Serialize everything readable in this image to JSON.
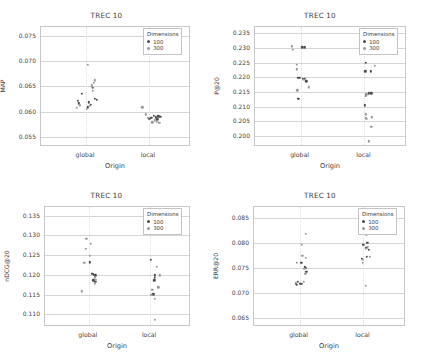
{
  "figure": {
    "panels_order": [
      "map",
      "p20",
      "ndcg20",
      "err20"
    ],
    "legend_title": "Dimensions",
    "legend_entries": [
      {
        "label": "100",
        "color": "#4d4d4d"
      },
      {
        "label": "300",
        "color": "#9a9a9a"
      }
    ],
    "shared_xlabel": "Origin",
    "shared_categories": [
      "global",
      "local"
    ],
    "shared_title": "TREC 10"
  },
  "chart_data": [
    {
      "type": "scatter",
      "id": "map",
      "title": "TREC 10",
      "xlabel": "Origin",
      "ylabel": "MAP",
      "categories": [
        "global",
        "local"
      ],
      "yticks": [
        0.055,
        0.06,
        0.065,
        0.07,
        0.075
      ],
      "ytick_labels": [
        "0.055",
        "0.060",
        "0.065",
        "0.070",
        "0.075"
      ],
      "ylim": [
        0.053,
        0.0768
      ],
      "grid": true,
      "legend_position": "top-right",
      "series": [
        {
          "name": "100",
          "color": "#4d4d4d",
          "points": [
            {
              "origin": "global",
              "jitter": -0.055,
              "y": 0.0622
            },
            {
              "origin": "global",
              "jitter": -0.03,
              "y": 0.0636
            },
            {
              "origin": "global",
              "jitter": -0.048,
              "y": 0.0617
            },
            {
              "origin": "global",
              "jitter": 0.018,
              "y": 0.0619
            },
            {
              "origin": "global",
              "jitter": 0.03,
              "y": 0.0614
            },
            {
              "origin": "global",
              "jitter": 0.046,
              "y": 0.0648
            },
            {
              "origin": "global",
              "jitter": 0.06,
              "y": 0.0625
            },
            {
              "origin": "global",
              "jitter": 0.072,
              "y": 0.0623
            },
            {
              "origin": "global",
              "jitter": 0.01,
              "y": 0.0609
            },
            {
              "origin": "local",
              "jitter": 0.03,
              "y": 0.0592
            },
            {
              "origin": "local",
              "jitter": 0.046,
              "y": 0.0589
            },
            {
              "origin": "local",
              "jitter": 0.062,
              "y": 0.0591
            },
            {
              "origin": "local",
              "jitter": 0.076,
              "y": 0.059
            },
            {
              "origin": "local",
              "jitter": 0.016,
              "y": 0.0588
            },
            {
              "origin": "local",
              "jitter": 0.002,
              "y": 0.0586
            },
            {
              "origin": "local",
              "jitter": 0.055,
              "y": 0.0585
            }
          ]
        },
        {
          "name": "300",
          "color": "#9a9a9a",
          "points": [
            {
              "origin": "global",
              "jitter": 0.012,
              "y": 0.0693
            },
            {
              "origin": "global",
              "jitter": 0.058,
              "y": 0.0662
            },
            {
              "origin": "global",
              "jitter": 0.054,
              "y": 0.0657
            },
            {
              "origin": "global",
              "jitter": 0.04,
              "y": 0.0652
            },
            {
              "origin": "global",
              "jitter": 0.038,
              "y": 0.0649
            },
            {
              "origin": "global",
              "jitter": 0.044,
              "y": 0.0641
            },
            {
              "origin": "global",
              "jitter": -0.062,
              "y": 0.0608
            },
            {
              "origin": "global",
              "jitter": -0.04,
              "y": 0.0613
            },
            {
              "origin": "global",
              "jitter": 0.006,
              "y": 0.0606
            },
            {
              "origin": "global",
              "jitter": 0.024,
              "y": 0.0612
            },
            {
              "origin": "local",
              "jitter": -0.045,
              "y": 0.0609
            },
            {
              "origin": "local",
              "jitter": -0.02,
              "y": 0.0595
            },
            {
              "origin": "local",
              "jitter": -0.006,
              "y": 0.0588
            },
            {
              "origin": "local",
              "jitter": 0.038,
              "y": 0.0583
            },
            {
              "origin": "local",
              "jitter": 0.052,
              "y": 0.0581
            },
            {
              "origin": "local",
              "jitter": 0.068,
              "y": 0.0578
            },
            {
              "origin": "local",
              "jitter": 0.022,
              "y": 0.0579
            }
          ]
        }
      ]
    },
    {
      "type": "scatter",
      "id": "p20",
      "title": "TREC 10",
      "xlabel": "Origin",
      "ylabel": "P@20",
      "categories": [
        "global",
        "local"
      ],
      "yticks": [
        0.2,
        0.205,
        0.21,
        0.215,
        0.22,
        0.225,
        0.23,
        0.235
      ],
      "ytick_labels": [
        "0.200",
        "0.205",
        "0.210",
        "0.215",
        "0.220",
        "0.225",
        "0.230",
        "0.235"
      ],
      "ylim": [
        0.1962,
        0.2372
      ],
      "grid": true,
      "legend_position": "top-right",
      "series": [
        {
          "name": "100",
          "color": "#4d4d4d",
          "points": [
            {
              "origin": "global",
              "jitter": 0.012,
              "y": 0.2302
            },
            {
              "origin": "global",
              "jitter": 0.028,
              "y": 0.2302
            },
            {
              "origin": "global",
              "jitter": -0.02,
              "y": 0.2198
            },
            {
              "origin": "global",
              "jitter": -0.008,
              "y": 0.2198
            },
            {
              "origin": "global",
              "jitter": 0.014,
              "y": 0.2196
            },
            {
              "origin": "global",
              "jitter": 0.026,
              "y": 0.2196
            },
            {
              "origin": "global",
              "jitter": 0.038,
              "y": 0.2186
            },
            {
              "origin": "global",
              "jitter": -0.016,
              "y": 0.2126
            },
            {
              "origin": "local",
              "jitter": 0.01,
              "y": 0.225
            },
            {
              "origin": "local",
              "jitter": 0.006,
              "y": 0.222
            },
            {
              "origin": "local",
              "jitter": 0.04,
              "y": 0.222
            },
            {
              "origin": "local",
              "jitter": 0.028,
              "y": 0.2146
            },
            {
              "origin": "local",
              "jitter": 0.046,
              "y": 0.2146
            },
            {
              "origin": "local",
              "jitter": 0.01,
              "y": 0.2136
            },
            {
              "origin": "local",
              "jitter": 0.004,
              "y": 0.2104
            }
          ]
        },
        {
          "name": "300",
          "color": "#9a9a9a",
          "points": [
            {
              "origin": "global",
              "jitter": -0.058,
              "y": 0.2306
            },
            {
              "origin": "global",
              "jitter": -0.052,
              "y": 0.2294
            },
            {
              "origin": "global",
              "jitter": -0.024,
              "y": 0.2242
            },
            {
              "origin": "global",
              "jitter": -0.026,
              "y": 0.2228
            },
            {
              "origin": "global",
              "jitter": 0.02,
              "y": 0.2192
            },
            {
              "origin": "global",
              "jitter": 0.052,
              "y": 0.2166
            },
            {
              "origin": "global",
              "jitter": -0.022,
              "y": 0.2156
            },
            {
              "origin": "local",
              "jitter": 0.07,
              "y": 0.224
            },
            {
              "origin": "local",
              "jitter": 0.012,
              "y": 0.2142
            },
            {
              "origin": "local",
              "jitter": 0.01,
              "y": 0.2074
            },
            {
              "origin": "local",
              "jitter": 0.008,
              "y": 0.2062
            },
            {
              "origin": "local",
              "jitter": 0.012,
              "y": 0.2058
            },
            {
              "origin": "local",
              "jitter": 0.05,
              "y": 0.2064
            },
            {
              "origin": "local",
              "jitter": 0.044,
              "y": 0.2032
            },
            {
              "origin": "local",
              "jitter": 0.03,
              "y": 0.1982
            }
          ]
        }
      ]
    },
    {
      "type": "scatter",
      "id": "ndcg20",
      "title": "TREC 10",
      "xlabel": "Origin",
      "ylabel": "nDCG@20",
      "categories": [
        "global",
        "local"
      ],
      "yticks": [
        0.11,
        0.115,
        0.12,
        0.125,
        0.13,
        0.135
      ],
      "ytick_labels": [
        "0.110",
        "0.115",
        "0.120",
        "0.125",
        "0.130",
        "0.135"
      ],
      "ylim": [
        0.1068,
        0.1372
      ],
      "grid": true,
      "legend_position": "top-right",
      "series": [
        {
          "name": "100",
          "color": "#4d4d4d",
          "points": [
            {
              "origin": "global",
              "jitter": 0.008,
              "y": 0.1232
            },
            {
              "origin": "global",
              "jitter": 0.024,
              "y": 0.1202
            },
            {
              "origin": "global",
              "jitter": 0.036,
              "y": 0.12
            },
            {
              "origin": "global",
              "jitter": 0.044,
              "y": 0.1199
            },
            {
              "origin": "global",
              "jitter": 0.03,
              "y": 0.1186
            },
            {
              "origin": "global",
              "jitter": 0.04,
              "y": 0.1183
            },
            {
              "origin": "global",
              "jitter": 0.05,
              "y": 0.1182
            },
            {
              "origin": "local",
              "jitter": 0.006,
              "y": 0.1239
            },
            {
              "origin": "local",
              "jitter": 0.03,
              "y": 0.1201
            },
            {
              "origin": "local",
              "jitter": 0.03,
              "y": 0.1198
            },
            {
              "origin": "local",
              "jitter": 0.034,
              "y": 0.1192
            },
            {
              "origin": "local",
              "jitter": 0.028,
              "y": 0.1186
            },
            {
              "origin": "local",
              "jitter": 0.022,
              "y": 0.1151
            }
          ]
        },
        {
          "name": "300",
          "color": "#9a9a9a",
          "points": [
            {
              "origin": "global",
              "jitter": -0.016,
              "y": 0.1291
            },
            {
              "origin": "global",
              "jitter": 0.012,
              "y": 0.1278
            },
            {
              "origin": "global",
              "jitter": -0.022,
              "y": 0.1266
            },
            {
              "origin": "global",
              "jitter": 0.006,
              "y": 0.1248
            },
            {
              "origin": "global",
              "jitter": -0.03,
              "y": 0.1231
            },
            {
              "origin": "global",
              "jitter": 0.04,
              "y": 0.1192
            },
            {
              "origin": "global",
              "jitter": 0.046,
              "y": 0.1188
            },
            {
              "origin": "global",
              "jitter": 0.042,
              "y": 0.1179
            },
            {
              "origin": "global",
              "jitter": -0.046,
              "y": 0.1158
            },
            {
              "origin": "local",
              "jitter": 0.046,
              "y": 0.1221
            },
            {
              "origin": "local",
              "jitter": 0.066,
              "y": 0.1199
            },
            {
              "origin": "local",
              "jitter": 0.056,
              "y": 0.1169
            },
            {
              "origin": "local",
              "jitter": 0.016,
              "y": 0.1163
            },
            {
              "origin": "local",
              "jitter": 0.008,
              "y": 0.115
            },
            {
              "origin": "local",
              "jitter": 0.03,
              "y": 0.114
            },
            {
              "origin": "local",
              "jitter": 0.03,
              "y": 0.1086
            }
          ]
        }
      ]
    },
    {
      "type": "scatter",
      "id": "err20",
      "title": "TREC 10",
      "xlabel": "Origin",
      "ylabel": "ERR@20",
      "categories": [
        "global",
        "local"
      ],
      "yticks": [
        0.065,
        0.07,
        0.075,
        0.08,
        0.085
      ],
      "ytick_labels": [
        "0.065",
        "0.070",
        "0.075",
        "0.080",
        "0.085"
      ],
      "ylim": [
        0.0632,
        0.0872
      ],
      "grid": true,
      "legend_position": "top-right",
      "series": [
        {
          "name": "100",
          "color": "#4d4d4d",
          "points": [
            {
              "origin": "global",
              "jitter": 0.01,
              "y": 0.076
            },
            {
              "origin": "global",
              "jitter": 0.034,
              "y": 0.0753
            },
            {
              "origin": "global",
              "jitter": 0.038,
              "y": 0.0751
            },
            {
              "origin": "global",
              "jitter": 0.044,
              "y": 0.0742
            },
            {
              "origin": "global",
              "jitter": -0.026,
              "y": 0.0719
            },
            {
              "origin": "global",
              "jitter": -0.02,
              "y": 0.0716
            },
            {
              "origin": "global",
              "jitter": -0.012,
              "y": 0.0722
            },
            {
              "origin": "global",
              "jitter": 0.004,
              "y": 0.0719
            },
            {
              "origin": "global",
              "jitter": 0.014,
              "y": 0.0718
            },
            {
              "origin": "local",
              "jitter": 0.026,
              "y": 0.084
            },
            {
              "origin": "local",
              "jitter": 0.006,
              "y": 0.0821
            },
            {
              "origin": "local",
              "jitter": 0.0,
              "y": 0.0797
            },
            {
              "origin": "local",
              "jitter": 0.026,
              "y": 0.0801
            },
            {
              "origin": "local",
              "jitter": 0.02,
              "y": 0.079
            },
            {
              "origin": "local",
              "jitter": 0.034,
              "y": 0.0786
            },
            {
              "origin": "local",
              "jitter": 0.022,
              "y": 0.0773
            },
            {
              "origin": "local",
              "jitter": -0.01,
              "y": 0.0768
            }
          ]
        },
        {
          "name": "300",
          "color": "#9a9a9a",
          "points": [
            {
              "origin": "global",
              "jitter": 0.04,
              "y": 0.0819
            },
            {
              "origin": "global",
              "jitter": 0.014,
              "y": 0.0796
            },
            {
              "origin": "global",
              "jitter": 0.018,
              "y": 0.0774
            },
            {
              "origin": "global",
              "jitter": 0.042,
              "y": 0.0771
            },
            {
              "origin": "global",
              "jitter": -0.018,
              "y": 0.076
            },
            {
              "origin": "global",
              "jitter": 0.03,
              "y": 0.0748
            },
            {
              "origin": "global",
              "jitter": 0.038,
              "y": 0.0739
            },
            {
              "origin": "global",
              "jitter": -0.024,
              "y": 0.0721
            },
            {
              "origin": "global",
              "jitter": 0.028,
              "y": 0.0722
            },
            {
              "origin": "local",
              "jitter": 0.012,
              "y": 0.0827
            },
            {
              "origin": "local",
              "jitter": 0.016,
              "y": 0.0824
            },
            {
              "origin": "local",
              "jitter": 0.02,
              "y": 0.0816
            },
            {
              "origin": "local",
              "jitter": 0.03,
              "y": 0.0792
            },
            {
              "origin": "local",
              "jitter": 0.016,
              "y": 0.0788
            },
            {
              "origin": "local",
              "jitter": 0.04,
              "y": 0.0772
            },
            {
              "origin": "local",
              "jitter": -0.006,
              "y": 0.0766
            },
            {
              "origin": "local",
              "jitter": -0.004,
              "y": 0.076
            },
            {
              "origin": "local",
              "jitter": 0.014,
              "y": 0.0715
            }
          ]
        }
      ]
    }
  ]
}
